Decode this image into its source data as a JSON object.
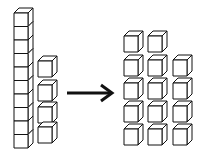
{
  "diagram": {
    "left_group": {
      "rod_cube_count": 10,
      "loose_cube_count": 4
    },
    "arrow": {
      "direction": "right",
      "color": "#111111"
    },
    "right_group": {
      "rows": [
        2,
        3,
        3,
        3,
        3
      ],
      "total_cubes": 14
    },
    "colors": {
      "stroke": "#111111",
      "fill": "#ffffff",
      "background": "#ffffff"
    }
  }
}
